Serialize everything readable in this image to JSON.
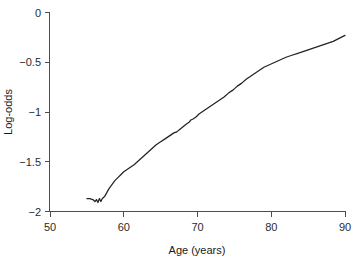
{
  "chart_data": {
    "type": "line",
    "title": "",
    "xlabel": "Age (years)",
    "ylabel": "Log-odds",
    "xlim": [
      50,
      90
    ],
    "ylim": [
      -2,
      0
    ],
    "grid": false,
    "legend": null,
    "xticks": [
      "50",
      "60",
      "70",
      "80",
      "90"
    ],
    "xtick_values": [
      50,
      60,
      70,
      80,
      90
    ],
    "yticks": [
      "0",
      "-0.5",
      "-1",
      "-1.5",
      "-2"
    ],
    "ytick_values": [
      0,
      -0.5,
      -1,
      -1.5,
      -2
    ],
    "series": [
      {
        "name": "Log-odds vs Age",
        "color": "#232323",
        "x": [
          55.0,
          55.4,
          55.8,
          56.1,
          56.3,
          56.5,
          56.7,
          56.9,
          57.1,
          57.4,
          57.7,
          58.0,
          58.4,
          58.8,
          59.2,
          59.6,
          60.0,
          60.4,
          60.8,
          61.0,
          61.4,
          62.0,
          62.6,
          63.2,
          63.8,
          64.4,
          65.0,
          65.6,
          66.2,
          66.8,
          67.2,
          67.5,
          68.0,
          68.5,
          68.9,
          69.1,
          69.4,
          69.8,
          70.2,
          70.6,
          71.2,
          71.8,
          72.4,
          73.0,
          73.6,
          74.2,
          74.8,
          75.4,
          76.0,
          76.6,
          77.2,
          77.8,
          78.4,
          79.0,
          79.6,
          80.2,
          80.8,
          81.4,
          82.0,
          82.8,
          83.6,
          84.4,
          85.2,
          86.0,
          86.8,
          87.6,
          88.4,
          89.2,
          90.0
        ],
        "y": [
          -1.87,
          -1.87,
          -1.88,
          -1.9,
          -1.88,
          -1.91,
          -1.87,
          -1.9,
          -1.87,
          -1.85,
          -1.81,
          -1.77,
          -1.73,
          -1.69,
          -1.66,
          -1.63,
          -1.6,
          -1.58,
          -1.56,
          -1.55,
          -1.53,
          -1.49,
          -1.45,
          -1.41,
          -1.37,
          -1.33,
          -1.3,
          -1.27,
          -1.24,
          -1.21,
          -1.2,
          -1.18,
          -1.15,
          -1.12,
          -1.1,
          -1.08,
          -1.07,
          -1.05,
          -1.02,
          -1.0,
          -0.97,
          -0.94,
          -0.91,
          -0.88,
          -0.85,
          -0.81,
          -0.78,
          -0.74,
          -0.71,
          -0.67,
          -0.64,
          -0.61,
          -0.58,
          -0.55,
          -0.53,
          -0.51,
          -0.49,
          -0.47,
          -0.45,
          -0.43,
          -0.41,
          -0.39,
          -0.37,
          -0.35,
          -0.33,
          -0.31,
          -0.29,
          -0.26,
          -0.23
        ]
      }
    ]
  }
}
